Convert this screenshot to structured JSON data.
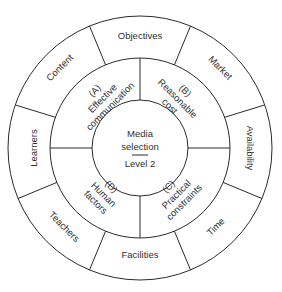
{
  "diagram": {
    "center": {
      "line1": "Media",
      "line2": "selection",
      "line3": "Level 2"
    },
    "middle_ring": [
      {
        "id": "A",
        "label1": "(A)",
        "label2": "Effective",
        "label3": "communication"
      },
      {
        "id": "B",
        "label1": "(B)",
        "label2": "Reasonable",
        "label3": "cost"
      },
      {
        "id": "C",
        "label1": "(C)",
        "label2": "Practical",
        "label3": "constraints"
      },
      {
        "id": "D",
        "label1": "(D)",
        "label2": "Human",
        "label3": "factors"
      }
    ],
    "outer_ring": [
      {
        "label": "Objectives"
      },
      {
        "label": "Market"
      },
      {
        "label": "Availability"
      },
      {
        "label": "Time"
      },
      {
        "label": "Facilities"
      },
      {
        "label": "Teachers"
      },
      {
        "label": "Learners"
      },
      {
        "label": "Content"
      }
    ]
  }
}
